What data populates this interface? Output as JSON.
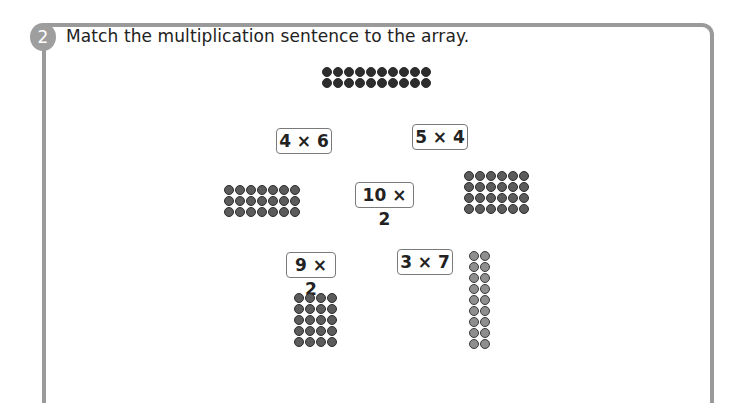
{
  "question": {
    "number": "2",
    "text": "Match the multiplication sentence to the array."
  },
  "cards": [
    {
      "label": "4 × 6",
      "left": 276,
      "top": 128,
      "width": 54
    },
    {
      "label": "5 × 4",
      "left": 412,
      "top": 124,
      "width": 54
    },
    {
      "label": "10 × 2",
      "left": 355,
      "top": 182,
      "width": 57
    },
    {
      "label": "9 × 2",
      "left": 286,
      "top": 252,
      "width": 48
    },
    {
      "label": "3 × 7",
      "left": 397,
      "top": 249,
      "width": 54
    }
  ],
  "arrays": [
    {
      "id": "top",
      "columns": 10,
      "rows": 2,
      "left": 322,
      "top": 67,
      "shade": "dark"
    },
    {
      "id": "left",
      "columns": 7,
      "rows": 3,
      "left": 224,
      "top": 185,
      "shade": "mid"
    },
    {
      "id": "right",
      "columns": 6,
      "rows": 4,
      "left": 464,
      "top": 171,
      "shade": "mid"
    },
    {
      "id": "lower-left",
      "columns": 4,
      "rows": 5,
      "left": 294,
      "top": 293,
      "shade": "mid"
    },
    {
      "id": "lower-right",
      "columns": 2,
      "rows": 9,
      "left": 469,
      "top": 251,
      "shade": "light"
    }
  ],
  "colors": {
    "frame": "#9a9a9a",
    "badge": "#9e9e9e",
    "text": "#222222"
  }
}
